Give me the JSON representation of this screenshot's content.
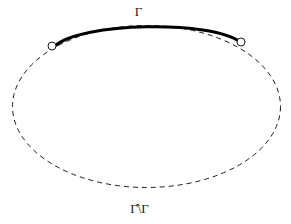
{
  "figure": {
    "name": "closed-curve-with-distinguished-arc",
    "background_color": "#ffffff",
    "width": 291,
    "height": 224,
    "labels": {
      "arc_label": "Γ",
      "complement_label": "Γ̂\\Γ"
    },
    "curve": {
      "type": "ellipse",
      "center_x": 146.5,
      "center_y": 106.5,
      "radius_x": 134,
      "radius_y": 81,
      "stroke_color": "#1a1a1a",
      "stroke_width": 1,
      "dash_pattern": "5 4",
      "style": "dashed"
    },
    "highlighted_arc": {
      "style": "solid",
      "stroke_color": "#000000",
      "stroke_width": 3,
      "start_x": 55,
      "start_y": 46,
      "end_x": 240,
      "end_y": 42,
      "apex_x": 147,
      "apex_y": 26
    },
    "endpoints": [
      {
        "name": "left-endpoint",
        "x": 52,
        "y": 46,
        "radius": 4,
        "fill_color": "#ffffff",
        "stroke_color": "#1a1a1a",
        "stroke_width": 1
      },
      {
        "name": "right-endpoint",
        "x": 241,
        "y": 42,
        "radius": 4,
        "fill_color": "#ffffff",
        "stroke_color": "#1a1a1a",
        "stroke_width": 1
      }
    ]
  }
}
